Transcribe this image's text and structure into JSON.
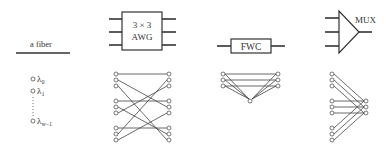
{
  "legend": {
    "fiber_label": "a fiber",
    "wavelengths": [
      "λ0",
      "λ1",
      "λw−1"
    ],
    "wavelength_symbol": "λ",
    "wavelength_subscripts": [
      "0",
      "1",
      "w−1"
    ]
  },
  "components": [
    {
      "name": "awg",
      "label_line1": "3 × 3",
      "label_line2": "AWG"
    },
    {
      "name": "fwc",
      "label": "FWC"
    },
    {
      "name": "mux",
      "label": "MUX"
    }
  ],
  "awg_wiring": {
    "groups": 3,
    "wavelengths_per_group": 3,
    "rule": "left group i, wavelength j -> right group (i+j) mod 3, wavelength j"
  },
  "fwc_wiring": {
    "inputs": 3,
    "outputs": 3,
    "converter_node": 1
  },
  "mux_wiring": {
    "inputs": 9,
    "outputs": 3
  },
  "colors": {
    "line": "#444444",
    "text": "#333333",
    "background": "#ffffff"
  }
}
